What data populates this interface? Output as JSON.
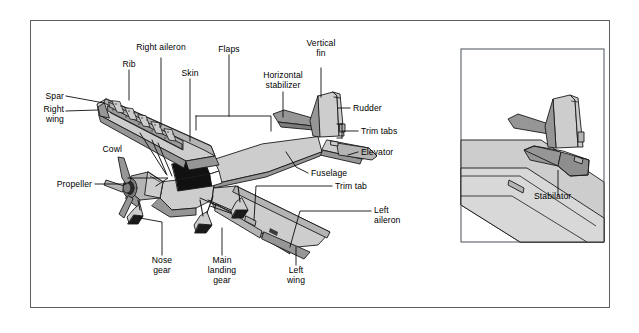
{
  "diagram": {
    "view": "three-quarter front-left perspective, cutaway right wing",
    "colors": {
      "border": "#5a5f66",
      "background": "#ffffff",
      "outline": "#1a1a1a",
      "surface_light": "#cdcdcd",
      "surface_mid": "#b4b4b4",
      "surface_dark": "#969696",
      "surface_darker": "#7d7d7d",
      "window_dark": "#111111",
      "label_text": "#000000"
    },
    "label_font_px": 8.6
  },
  "labels": [
    {
      "id": "spar",
      "text": "Spar",
      "lines": [
        "Spar"
      ]
    },
    {
      "id": "right-wing",
      "text": "Right wing",
      "lines": [
        "Right",
        "wing"
      ]
    },
    {
      "id": "rib",
      "text": "Rib",
      "lines": [
        "Rib"
      ]
    },
    {
      "id": "right-aileron",
      "text": "Right aileron",
      "lines": [
        "Right aileron"
      ]
    },
    {
      "id": "skin",
      "text": "Skin",
      "lines": [
        "Skin"
      ]
    },
    {
      "id": "flaps",
      "text": "Flaps",
      "lines": [
        "Flaps"
      ]
    },
    {
      "id": "horizontal-stabilizer",
      "text": "Horizontal stabilizer",
      "lines": [
        "Horizontal",
        "stabilizer"
      ]
    },
    {
      "id": "vertical-fin",
      "text": "Vertical fin",
      "lines": [
        "Vertical",
        "fin"
      ]
    },
    {
      "id": "rudder",
      "text": "Rudder",
      "lines": [
        "Rudder"
      ]
    },
    {
      "id": "trim-tabs",
      "text": "Trim tabs",
      "lines": [
        "Trim tabs"
      ]
    },
    {
      "id": "elevator",
      "text": "Elevator",
      "lines": [
        "Elevator"
      ]
    },
    {
      "id": "fuselage",
      "text": "Fuselage",
      "lines": [
        "Fuselage"
      ]
    },
    {
      "id": "trim-tab",
      "text": "Trim tab",
      "lines": [
        "Trim tab"
      ]
    },
    {
      "id": "left-aileron",
      "text": "Left aileron",
      "lines": [
        "Left",
        "aileron"
      ]
    },
    {
      "id": "left-wing",
      "text": "Left wing",
      "lines": [
        "Left",
        "wing"
      ]
    },
    {
      "id": "cowl",
      "text": "Cowl",
      "lines": [
        "Cowl"
      ]
    },
    {
      "id": "propeller",
      "text": "Propeller",
      "lines": [
        "Propeller"
      ]
    },
    {
      "id": "nose-gear",
      "text": "Nose gear",
      "lines": [
        "Nose",
        "gear"
      ]
    },
    {
      "id": "main-landing-gear",
      "text": "Main landing gear",
      "lines": [
        "Main",
        "landing",
        "gear"
      ]
    },
    {
      "id": "stabilator",
      "text": "Stabilator",
      "lines": [
        "Stabilator"
      ]
    }
  ],
  "label_text": {
    "spar": "Spar",
    "right_wing_1": "Right",
    "right_wing_2": "wing",
    "rib": "Rib",
    "right_aileron": "Right aileron",
    "skin": "Skin",
    "flaps": "Flaps",
    "horizontal_stabilizer_1": "Horizontal",
    "horizontal_stabilizer_2": "stabilizer",
    "vertical_fin_1": "Vertical",
    "vertical_fin_2": "fin",
    "rudder": "Rudder",
    "trim_tabs": "Trim tabs",
    "elevator": "Elevator",
    "fuselage": "Fuselage",
    "trim_tab": "Trim tab",
    "left_aileron_1": "Left",
    "left_aileron_2": "aileron",
    "left_wing_1": "Left",
    "left_wing_2": "wing",
    "cowl": "Cowl",
    "propeller": "Propeller",
    "nose_gear_1": "Nose",
    "nose_gear_2": "gear",
    "main_gear_1": "Main",
    "main_gear_2": "landing",
    "main_gear_3": "gear",
    "stabilator": "Stabilator"
  },
  "inset": {
    "name": "stabilator-detail",
    "caption": "Stabilator",
    "description": "alternate tail with one-piece movable stabilator instead of fixed horizontal stabilizer plus elevator"
  }
}
